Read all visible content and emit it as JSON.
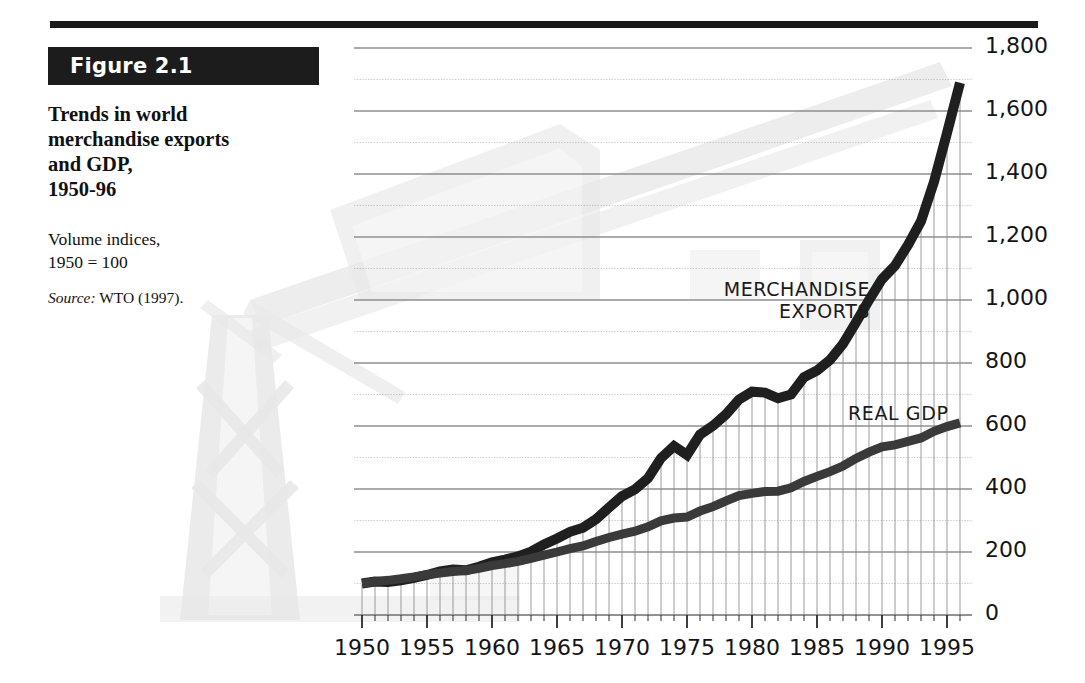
{
  "figure": {
    "badge_label": "Figure 2.1",
    "title_lines": [
      "Trends in world",
      "merchandise exports",
      "and GDP,",
      "1950-96"
    ],
    "subtitle_lines": [
      "Volume indices,",
      "1950 = 100"
    ],
    "source_prefix": "Source:",
    "source_text": " WTO (1997)."
  },
  "colors": {
    "ink": "#1a1a1a",
    "exports_line": "#1f1f1f",
    "gdp_line": "#3a3a3a",
    "grid": "#8a8a8a",
    "minor_grid": "#9a9a9a",
    "watermark": "#e8e8e8",
    "badge_bg": "#1c1c1c",
    "badge_text": "#ffffff"
  },
  "chart_data": {
    "type": "line",
    "title": "Trends in world merchandise exports and GDP, 1950-96",
    "subtitle": "Volume indices, 1950 = 100",
    "xlabel": "",
    "ylabel": "",
    "xlim": [
      1950,
      1996
    ],
    "ylim": [
      0,
      1800
    ],
    "ytick_step": 200,
    "yticks": [
      0,
      200,
      400,
      600,
      800,
      1000,
      1200,
      1400,
      1600,
      1800
    ],
    "ytick_labels": [
      "0",
      "200",
      "400",
      "600",
      "800",
      "1,000",
      "1,200",
      "1,400",
      "1,600",
      "1,800"
    ],
    "xticks": [
      1950,
      1955,
      1960,
      1965,
      1970,
      1975,
      1980,
      1985,
      1990,
      1995
    ],
    "xtick_labels": [
      "1950",
      "1955",
      "1960",
      "1965",
      "1970",
      "1975",
      "1980",
      "1985",
      "1990",
      "1995"
    ],
    "x_minor_tick_step": 1,
    "grid": "horizontal gridlines every 100 units; vertical drop-lines each year from baseline to merchandise exports curve",
    "legend": "inline annotations",
    "annotations": [
      {
        "label_lines": [
          "MERCHANDISE",
          "EXPORTS"
        ],
        "series": "Merchandise exports",
        "align": "right"
      },
      {
        "label_lines": [
          "REAL GDP"
        ],
        "series": "Real GDP",
        "align": "left"
      }
    ],
    "x": [
      1950,
      1951,
      1952,
      1953,
      1954,
      1955,
      1956,
      1957,
      1958,
      1959,
      1960,
      1961,
      1962,
      1963,
      1964,
      1965,
      1966,
      1967,
      1968,
      1969,
      1970,
      1971,
      1972,
      1973,
      1974,
      1975,
      1976,
      1977,
      1978,
      1979,
      1980,
      1981,
      1982,
      1983,
      1984,
      1985,
      1986,
      1987,
      1988,
      1989,
      1990,
      1991,
      1992,
      1993,
      1994,
      1995,
      1996
    ],
    "series": [
      {
        "name": "Merchandise exports",
        "values": [
          100,
          106,
          105,
          110,
          118,
          127,
          138,
          144,
          142,
          153,
          167,
          176,
          186,
          201,
          224,
          243,
          264,
          277,
          304,
          341,
          377,
          399,
          434,
          498,
          536,
          508,
          573,
          601,
          637,
          684,
          709,
          706,
          688,
          700,
          755,
          776,
          810,
          861,
          929,
          1000,
          1066,
          1109,
          1175,
          1250,
          1375,
          1530,
          1690
        ]
      },
      {
        "name": "Real GDP",
        "values": [
          100,
          106,
          110,
          115,
          121,
          128,
          133,
          138,
          141,
          148,
          157,
          163,
          170,
          180,
          190,
          200,
          211,
          219,
          233,
          246,
          257,
          266,
          280,
          299,
          308,
          311,
          330,
          344,
          362,
          379,
          386,
          392,
          393,
          404,
          424,
          440,
          455,
          473,
          497,
          517,
          534,
          540,
          551,
          562,
          583,
          598,
          610
        ]
      }
    ]
  }
}
